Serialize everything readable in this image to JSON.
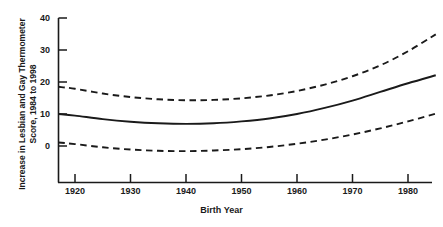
{
  "chart_data": {
    "type": "line",
    "title": "",
    "xlabel": "Birth Year",
    "ylabel": "Increase in Lesbian and Gay Thermometer Score, 1984 to 1998",
    "ylabel_line1": "Increase in Lesbian and Gay Thermometer",
    "ylabel_line2": "Score, 1984 to 1998",
    "xlim": [
      1917,
      1985
    ],
    "ylim": [
      -4,
      40
    ],
    "grid": false,
    "legend": "none",
    "xticks": [
      1920,
      1930,
      1940,
      1950,
      1960,
      1970,
      1980
    ],
    "xtick_labels": [
      "1920",
      "1930",
      "1940",
      "1950",
      "1960",
      "1970",
      "1980"
    ],
    "yticks": [
      0,
      10,
      20,
      30,
      40
    ],
    "ytick_labels": [
      "0",
      "10",
      "20",
      "30",
      "40"
    ],
    "x": [
      1917,
      1920,
      1925,
      1930,
      1935,
      1940,
      1945,
      1950,
      1955,
      1960,
      1965,
      1970,
      1975,
      1980,
      1985
    ],
    "series": [
      {
        "name": "upper-confidence-bound",
        "style": "dashed",
        "color": "#1a1a1a",
        "values": [
          18.5,
          17.9,
          16.4,
          15.3,
          14.6,
          14.3,
          14.4,
          14.9,
          15.8,
          17.2,
          19.2,
          21.8,
          25.2,
          29.6,
          34.9
        ]
      },
      {
        "name": "fitted-estimate",
        "style": "solid",
        "color": "#1a1a1a",
        "values": [
          10.0,
          9.5,
          8.4,
          7.6,
          7.1,
          6.9,
          7.1,
          7.7,
          8.6,
          10.0,
          11.9,
          14.2,
          16.9,
          19.6,
          22.1
        ]
      },
      {
        "name": "lower-confidence-bound",
        "style": "dashed",
        "color": "#1a1a1a",
        "values": [
          1.1,
          0.6,
          -0.4,
          -1.1,
          -1.5,
          -1.6,
          -1.4,
          -1.0,
          -0.3,
          0.7,
          2.0,
          3.6,
          5.5,
          7.7,
          10.1
        ]
      }
    ]
  },
  "axis": {
    "x_title": "Birth Year",
    "y_title_line1": "Increase in Lesbian and Gay Thermometer",
    "y_title_line2": "Score, 1984 to 1998"
  },
  "colors": {
    "ink": "#1a1a1a",
    "background": "#ffffff"
  }
}
